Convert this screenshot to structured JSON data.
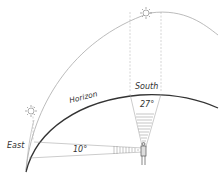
{
  "diagram": {
    "labels": {
      "south": "South",
      "east": "East",
      "horizon": "Horizon",
      "angle_south": "27°",
      "angle_east": "10°"
    },
    "icons": [
      "sun-icon-south",
      "sun-icon-east",
      "observer-figure"
    ],
    "colors": {
      "horizon_line": "#333333",
      "sky_arc": "#aaaaaa",
      "dashed_lines": "#999999",
      "text": "#333333"
    }
  }
}
